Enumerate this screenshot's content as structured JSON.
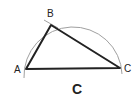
{
  "diagram": {
    "vertices": [
      {
        "name": "A",
        "label": "A"
      },
      {
        "name": "B",
        "label": "B"
      },
      {
        "name": "C",
        "label": "C"
      }
    ],
    "caption": "C",
    "colors": {
      "triangle": "#222222",
      "arc": "#999999",
      "text": "#222222"
    }
  }
}
